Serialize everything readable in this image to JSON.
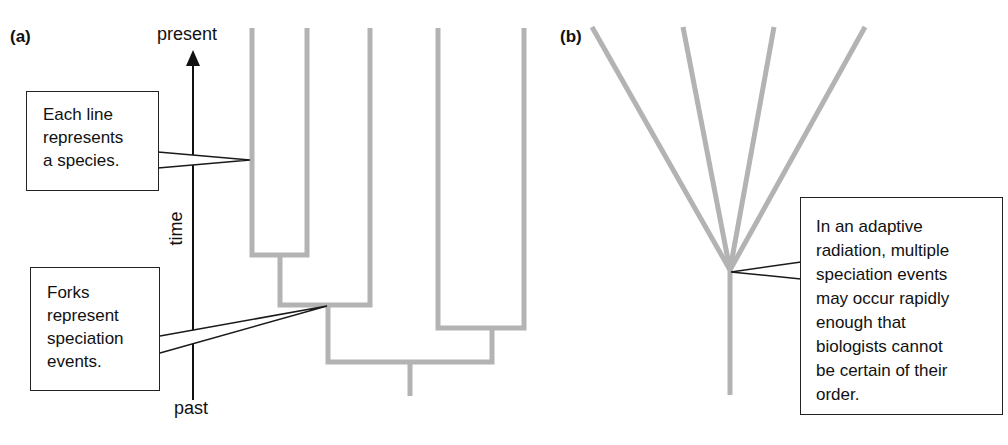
{
  "panel_a": {
    "label": "(a)",
    "axis": {
      "top_label": "present",
      "bottom_label": "past",
      "axis_label": "time"
    },
    "callouts": [
      {
        "text": "Each line\nrepresents\na species."
      },
      {
        "text": "Forks\nrepresent\nspeciation\nevents."
      }
    ]
  },
  "panel_b": {
    "label": "(b)",
    "callout": {
      "text": "In an adaptive\nradiation, multiple\nspeciation events\nmay occur rapidly\nenough that\nbiologists cannot\nbe certain of their\norder."
    }
  },
  "colors": {
    "branch": "#b3b3b3",
    "line": "#1a1a1a"
  }
}
